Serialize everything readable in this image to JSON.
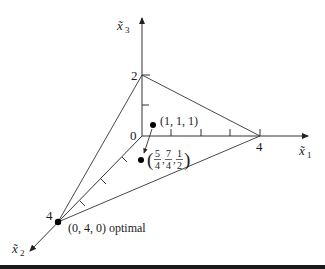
{
  "figure": {
    "axes": {
      "x1": {
        "label": "x̃",
        "sub": "1",
        "tick_label": "4"
      },
      "x2": {
        "label": "x̃",
        "sub": "2",
        "tick_label": "4"
      },
      "x3": {
        "label": "x̃",
        "sub": "3",
        "tick_label": "2"
      },
      "origin_label": "0"
    },
    "points": {
      "start": {
        "label": "(1, 1, 1)"
      },
      "next": {
        "paren_open": "(",
        "paren_close": ")",
        "f1_num": "5",
        "f1_den": "4",
        "f2_num": "7",
        "f2_den": "4",
        "f3_num": "1",
        "f3_den": "2",
        "sep": ","
      },
      "optimal": {
        "label": "(0, 4, 0) optimal"
      }
    },
    "colors": {
      "line": "#333333",
      "point": "#000000",
      "background": "#ffffff"
    }
  }
}
